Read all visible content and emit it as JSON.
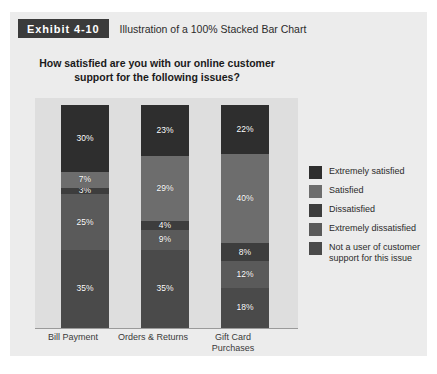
{
  "exhibit": {
    "badge": "Exhibit 4-10",
    "caption": "Illustration of a 100% Stacked Bar Chart"
  },
  "chart_data": {
    "type": "bar",
    "stacked": "100%",
    "title": "How satisfied are you with our online customer support for the following issues?",
    "xlabel": "",
    "ylabel": "",
    "ylim": [
      0,
      100
    ],
    "grid": false,
    "legend_position": "right",
    "categories": [
      "Bill Payment",
      "Orders & Returns",
      "Gift Card Purchases"
    ],
    "series": [
      {
        "name": "Extremely satisfied",
        "color": "#2e2e2e",
        "values": [
          30,
          23,
          22
        ]
      },
      {
        "name": "Satisfied",
        "color": "#6d6d6d",
        "values": [
          7,
          29,
          40
        ]
      },
      {
        "name": "Dissatisfied",
        "color": "#3d3d3d",
        "values": [
          3,
          4,
          8
        ]
      },
      {
        "name": "Extremely dissatisfied",
        "color": "#5a5a5a",
        "values": [
          25,
          9,
          12
        ]
      },
      {
        "name": "Not a user of customer support for this issue",
        "color": "#4a4a4a",
        "values": [
          35,
          35,
          18
        ]
      }
    ],
    "bars": [
      {
        "category": "Bill Payment",
        "category_line1": "Bill Payment",
        "category_line2": "",
        "segments": [
          {
            "label": "30%",
            "value": 30,
            "color": "#2e2e2e"
          },
          {
            "label": "7%",
            "value": 7,
            "color": "#6d6d6d"
          },
          {
            "label": "3%",
            "value": 3,
            "color": "#3d3d3d"
          },
          {
            "label": "25%",
            "value": 25,
            "color": "#5a5a5a"
          },
          {
            "label": "35%",
            "value": 35,
            "color": "#4a4a4a"
          }
        ]
      },
      {
        "category": "Orders & Returns",
        "category_line1": "Orders & Returns",
        "category_line2": "",
        "segments": [
          {
            "label": "23%",
            "value": 23,
            "color": "#2e2e2e"
          },
          {
            "label": "29%",
            "value": 29,
            "color": "#6d6d6d"
          },
          {
            "label": "4%",
            "value": 4,
            "color": "#3d3d3d"
          },
          {
            "label": "9%",
            "value": 9,
            "color": "#5a5a5a"
          },
          {
            "label": "35%",
            "value": 35,
            "color": "#4a4a4a"
          }
        ]
      },
      {
        "category": "Gift Card Purchases",
        "category_line1": "Gift Card",
        "category_line2": "Purchases",
        "segments": [
          {
            "label": "22%",
            "value": 22,
            "color": "#2e2e2e"
          },
          {
            "label": "40%",
            "value": 40,
            "color": "#6d6d6d"
          },
          {
            "label": "8%",
            "value": 8,
            "color": "#3d3d3d"
          },
          {
            "label": "12%",
            "value": 12,
            "color": "#5a5a5a"
          },
          {
            "label": "18%",
            "value": 18,
            "color": "#4a4a4a"
          }
        ]
      }
    ],
    "legend": [
      {
        "label": "Extremely satisfied",
        "color": "#2e2e2e"
      },
      {
        "label": "Satisfied",
        "color": "#6d6d6d"
      },
      {
        "label": "Dissatisfied",
        "color": "#3d3d3d"
      },
      {
        "label": "Extremely dissatisfied",
        "color": "#5a5a5a"
      },
      {
        "label": "Not a user of customer\nsupport for this issue",
        "color": "#4a4a4a"
      }
    ]
  },
  "colors": {
    "page_background": "#ffffff",
    "panel_background": "#ececec",
    "plot_background": "#dedede",
    "badge_background": "#3b3b3b",
    "badge_text": "#ffffff",
    "axis_line": "#9a9a9a"
  }
}
